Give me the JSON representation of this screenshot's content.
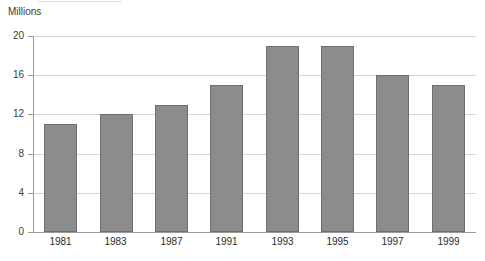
{
  "chart_data": {
    "type": "bar",
    "title": "",
    "subtitle": "",
    "unit_label": "Millions",
    "xlabel": "",
    "ylabel": "Millions",
    "categories": [
      "1981",
      "1983",
      "1987",
      "1991",
      "1993",
      "1995",
      "1997",
      "1999"
    ],
    "values": [
      11,
      12,
      13,
      15,
      19,
      19,
      16,
      15
    ],
    "series": [
      {
        "name": "Millions",
        "values": [
          11,
          12,
          13,
          15,
          19,
          19,
          16,
          15
        ]
      }
    ],
    "ylim": [
      0,
      20
    ],
    "y_ticks": [
      0,
      4,
      8,
      12,
      16,
      20
    ],
    "y_tick_labels": [
      "0",
      "4",
      "8",
      "12",
      "16",
      "20"
    ],
    "grid": true,
    "grid_axis": "y",
    "legend": false,
    "legend_position": "none",
    "bar_color": "#8c8c8c",
    "bar_border_color": "#6f6f6f",
    "gridline_color": "#d6d6d6",
    "axis_color": "#9a9a9a",
    "background_color": "#ffffff"
  }
}
